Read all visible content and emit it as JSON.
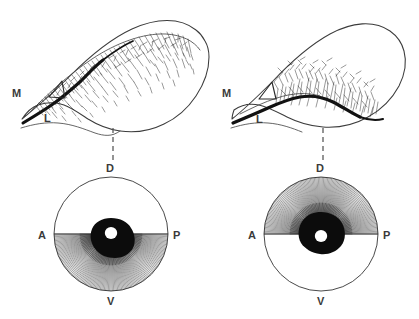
{
  "figure": {
    "background_color": "#ffffff",
    "ink_color": "#2b2b2b",
    "label_color": "#3a3a3a",
    "panels": [
      {
        "id": "top-left",
        "view": "sagittal-section",
        "labels": {
          "medial": "M",
          "lateral": "L"
        },
        "marker": "open-triangle",
        "fiber_zone": "dorsal-upper-margin",
        "fiber_direction": "downward-inward",
        "connector": "dashed-vertical"
      },
      {
        "id": "top-right",
        "view": "sagittal-section",
        "labels": {
          "medial": "M",
          "lateral": "L"
        },
        "marker": "open-triangle",
        "fiber_zone": "ventral-lower-margin",
        "fiber_direction": "upward-outward",
        "connector": "dashed-vertical"
      },
      {
        "id": "bottom-left",
        "view": "flat-mount-circular",
        "labels": {
          "dorsal": "D",
          "anterior": "A",
          "posterior": "P",
          "ventral": "V"
        },
        "ray_hemisphere": "ventral",
        "ray_count": 132,
        "hub": "optic-disc"
      },
      {
        "id": "bottom-right",
        "view": "flat-mount-circular",
        "labels": {
          "dorsal": "D",
          "anterior": "A",
          "posterior": "P",
          "ventral": "V"
        },
        "ray_hemisphere": "dorsal",
        "ray_count": 132,
        "hub": "optic-disc"
      }
    ],
    "axis_labels": {
      "D": "D",
      "V": "V",
      "A": "A",
      "P": "P",
      "M": "M",
      "L": "L"
    }
  }
}
